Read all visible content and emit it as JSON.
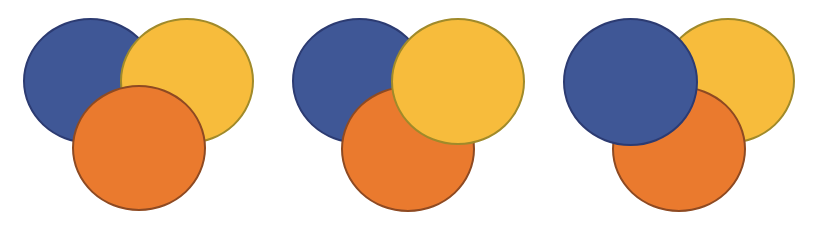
{
  "diagram": {
    "colors": {
      "blue": "#3f5796",
      "blue_border": "#2c3b72",
      "yellow": "#f7bc3c",
      "yellow_border": "#a08a2a",
      "orange": "#ea7a2e",
      "orange_border": "#8e4a22",
      "background": "#ffffff"
    },
    "groups": [
      {
        "id": "group-1",
        "stacking_order_bottom_to_top": [
          "blue",
          "yellow",
          "orange"
        ],
        "top_circle": "orange"
      },
      {
        "id": "group-2",
        "stacking_order_bottom_to_top": [
          "blue",
          "orange",
          "yellow"
        ],
        "top_circle": "yellow"
      },
      {
        "id": "group-3",
        "stacking_order_bottom_to_top": [
          "yellow",
          "orange",
          "blue"
        ],
        "top_circle": "blue"
      }
    ]
  }
}
